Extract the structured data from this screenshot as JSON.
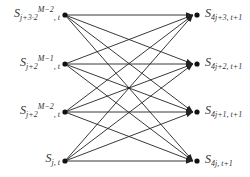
{
  "diagram": {
    "type": "butterfly-graph",
    "left_nodes": [
      {
        "id": "L0",
        "base": "S",
        "sub": "j+3·2",
        "sup": "M−2",
        "tail": ", t",
        "y": 15
      },
      {
        "id": "L1",
        "base": "S",
        "sub": "j+2",
        "sup": "M−1",
        "tail": ", t",
        "y": 64
      },
      {
        "id": "L2",
        "base": "S",
        "sub": "j+2",
        "sup": "M−2",
        "tail": ", t",
        "y": 112
      },
      {
        "id": "L3",
        "base": "S",
        "sub": "j, t",
        "sup": "",
        "tail": "",
        "y": 161
      }
    ],
    "right_nodes": [
      {
        "id": "R0",
        "base": "S",
        "sub": "4j+3, t+1",
        "y": 15
      },
      {
        "id": "R1",
        "base": "S",
        "sub": "4j+2, t+1",
        "y": 64
      },
      {
        "id": "R2",
        "base": "S",
        "sub": "4j+1, t+1",
        "y": 112
      },
      {
        "id": "R3",
        "base": "S",
        "sub": "4j, t+1",
        "y": 161
      }
    ],
    "edges": "complete bipartite: every left node connects to every right node with arrow",
    "colors": {
      "line": "#222222",
      "node": "#111111",
      "text": "#333333"
    }
  }
}
